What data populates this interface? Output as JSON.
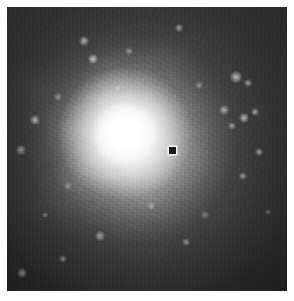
{
  "figure": {
    "kind": "grayscale-astronomical-image",
    "canvas": {
      "width": 294,
      "height": 301
    },
    "margin": {
      "left": 7,
      "top": 7,
      "right": 7,
      "bottom": 10
    },
    "field": {
      "x": 7,
      "y": 7,
      "width": 280,
      "height": 284
    },
    "background_color": "#ffffff",
    "sky_color": "#262626",
    "core_color": "#ffffff",
    "marker_color": "#1a1a1a"
  },
  "galaxy": {
    "center": {
      "x": 133,
      "y": 148
    },
    "core_radius_px": 34,
    "halo_radius_px": 118,
    "peak_level": 255,
    "sky_level": 38
  },
  "marker": {
    "name": "position-marker",
    "shape": "filled-square",
    "center": {
      "x": 172,
      "y": 150
    },
    "size_px": 7,
    "color": "#1a1a1a"
  },
  "point_sources": [
    {
      "x": 179,
      "y": 28,
      "r": 3.2,
      "b": 0.55
    },
    {
      "x": 84,
      "y": 41,
      "r": 3.6,
      "b": 0.62
    },
    {
      "x": 93,
      "y": 59,
      "r": 4.2,
      "b": 0.72
    },
    {
      "x": 129,
      "y": 51,
      "r": 3.0,
      "b": 0.42
    },
    {
      "x": 236,
      "y": 77,
      "r": 4.4,
      "b": 0.7
    },
    {
      "x": 248,
      "y": 83,
      "r": 3.4,
      "b": 0.52
    },
    {
      "x": 224,
      "y": 110,
      "r": 3.6,
      "b": 0.58
    },
    {
      "x": 244,
      "y": 118,
      "r": 4.0,
      "b": 0.66
    },
    {
      "x": 232,
      "y": 126,
      "r": 3.2,
      "b": 0.5
    },
    {
      "x": 255,
      "y": 112,
      "r": 3.4,
      "b": 0.56
    },
    {
      "x": 35,
      "y": 120,
      "r": 4.0,
      "b": 0.6
    },
    {
      "x": 58,
      "y": 97,
      "r": 3.2,
      "b": 0.44
    },
    {
      "x": 21,
      "y": 150,
      "r": 3.6,
      "b": 0.48
    },
    {
      "x": 259,
      "y": 152,
      "r": 3.4,
      "b": 0.5
    },
    {
      "x": 243,
      "y": 176,
      "r": 3.2,
      "b": 0.46
    },
    {
      "x": 100,
      "y": 236,
      "r": 3.8,
      "b": 0.56
    },
    {
      "x": 63,
      "y": 259,
      "r": 3.0,
      "b": 0.4
    },
    {
      "x": 22,
      "y": 273,
      "r": 3.6,
      "b": 0.5
    },
    {
      "x": 186,
      "y": 242,
      "r": 3.2,
      "b": 0.44
    },
    {
      "x": 205,
      "y": 215,
      "r": 2.8,
      "b": 0.38
    },
    {
      "x": 151,
      "y": 206,
      "r": 3.0,
      "b": 0.4
    },
    {
      "x": 118,
      "y": 88,
      "r": 2.6,
      "b": 0.34
    },
    {
      "x": 199,
      "y": 85,
      "r": 2.8,
      "b": 0.38
    },
    {
      "x": 68,
      "y": 186,
      "r": 2.8,
      "b": 0.36
    },
    {
      "x": 268,
      "y": 212,
      "r": 2.6,
      "b": 0.32
    },
    {
      "x": 45,
      "y": 215,
      "r": 2.6,
      "b": 0.32
    }
  ],
  "lumps": [
    {
      "x": 108,
      "y": 96,
      "w": 66,
      "h": 58,
      "o": 0.1
    },
    {
      "x": 150,
      "y": 120,
      "w": 58,
      "h": 54,
      "o": 0.09
    },
    {
      "x": 88,
      "y": 170,
      "w": 72,
      "h": 62,
      "o": 0.1
    },
    {
      "x": 150,
      "y": 182,
      "w": 60,
      "h": 56,
      "o": 0.08
    },
    {
      "x": 70,
      "y": 128,
      "w": 64,
      "h": 60,
      "o": 0.07
    },
    {
      "x": 120,
      "y": 72,
      "w": 82,
      "h": 52,
      "o": 0.05
    },
    {
      "x": 180,
      "y": 160,
      "w": 74,
      "h": 64,
      "o": 0.05
    },
    {
      "x": 60,
      "y": 200,
      "w": 90,
      "h": 70,
      "o": 0.04
    },
    {
      "x": 170,
      "y": 60,
      "w": 78,
      "h": 60,
      "o": 0.035
    },
    {
      "x": 40,
      "y": 90,
      "w": 86,
      "h": 72,
      "o": 0.03
    }
  ]
}
